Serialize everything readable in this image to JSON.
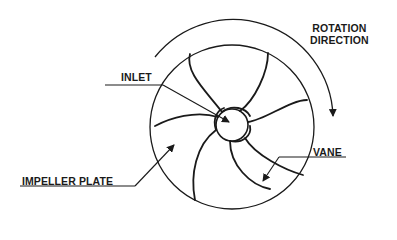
{
  "diagram": {
    "labels": {
      "inlet": "INLET",
      "rotation_line1": "ROTATION",
      "rotation_line2": "DIRECTION",
      "impeller_plate": "IMPELLER PLATE",
      "vane": "VANE"
    },
    "colors": {
      "stroke": "#1a1a1a",
      "background": "#ffffff"
    }
  }
}
